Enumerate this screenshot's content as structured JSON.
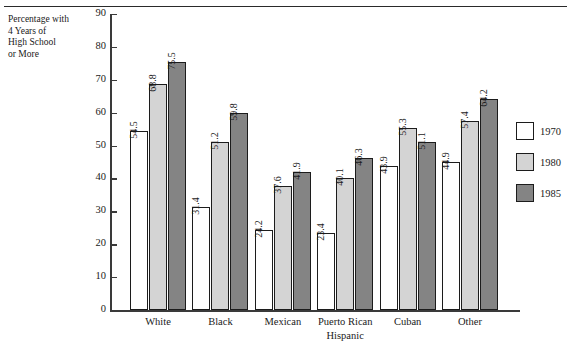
{
  "caption": {
    "lines": [
      "Percentage with",
      "4 Years of",
      "High School",
      "or More"
    ]
  },
  "chart_data": {
    "type": "bar",
    "title": "",
    "subtitle": "",
    "xlabel": "",
    "ylabel": "Percentage with 4 Years of High School or More",
    "ylim": [
      0,
      90
    ],
    "yticks": [
      0,
      10,
      20,
      30,
      40,
      50,
      60,
      70,
      80,
      90
    ],
    "ytick_labels": [
      "0",
      "10",
      "20",
      "30",
      "40",
      "50",
      "60",
      "70",
      "80",
      "90"
    ],
    "grid": false,
    "legend_position": "right",
    "categories": [
      "White",
      "Black",
      "Mexican",
      "Puerto Rican",
      "Cuban",
      "Other"
    ],
    "group_annotation": {
      "label": "Hispanic",
      "spans": [
        "Mexican",
        "Puerto Rican",
        "Cuban"
      ]
    },
    "series": [
      {
        "name": "1970",
        "color": "#ffffff",
        "values": [
          54.5,
          31.4,
          24.2,
          23.4,
          43.9,
          44.9
        ],
        "labels": [
          "54.5",
          "31.4",
          "24.2",
          "23.4",
          "43.9",
          "44.9"
        ]
      },
      {
        "name": "1980",
        "color": "#d4d4d4",
        "values": [
          68.8,
          51.2,
          37.6,
          40.1,
          55.3,
          57.4
        ],
        "labels": [
          "68.8",
          "51.2",
          "37.6",
          "40.1",
          "55.3",
          "57.4"
        ]
      },
      {
        "name": "1985",
        "color": "#848484",
        "values": [
          75.5,
          59.8,
          41.9,
          46.3,
          51.1,
          64.2
        ],
        "labels": [
          "75.5",
          "59.8",
          "41.9",
          "46.3",
          "51.1",
          "64.2"
        ]
      }
    ]
  },
  "legend": {
    "items": [
      {
        "label": "1970",
        "color": "#ffffff"
      },
      {
        "label": "1980",
        "color": "#d4d4d4"
      },
      {
        "label": "1985",
        "color": "#848484"
      }
    ]
  }
}
